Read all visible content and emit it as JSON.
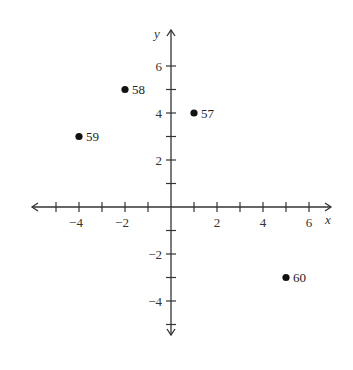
{
  "chart_data": {
    "type": "scatter",
    "title": "",
    "xlabel": "x",
    "ylabel": "y",
    "xlim": [
      -6,
      7
    ],
    "ylim": [
      -6,
      7
    ],
    "grid": false,
    "x_ticks": [
      -5,
      -4,
      -3,
      -2,
      -1,
      1,
      2,
      3,
      4,
      5,
      6
    ],
    "x_tick_labels": {
      "-4": "−4",
      "-2": "−2",
      "2": "2",
      "4": "4",
      "6": "6"
    },
    "y_ticks": [
      -5,
      -4,
      -3,
      -2,
      -1,
      1,
      2,
      3,
      4,
      5,
      6
    ],
    "y_tick_labels": {
      "6": "6",
      "4": "4",
      "2": "2",
      "-2": "−2",
      "-4": "−4"
    },
    "points": [
      {
        "label": "57",
        "x": 1,
        "y": 4
      },
      {
        "label": "58",
        "x": -2,
        "y": 5
      },
      {
        "label": "59",
        "x": -4,
        "y": 3
      },
      {
        "label": "60",
        "x": 5,
        "y": -3
      }
    ]
  }
}
